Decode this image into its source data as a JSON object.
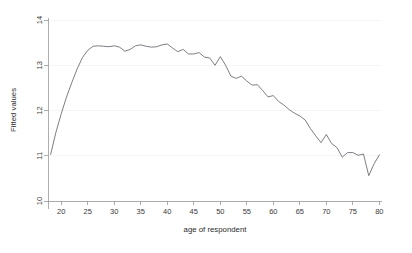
{
  "chart_data": {
    "type": "line",
    "title": "",
    "subtitle": "",
    "xlabel": "age of respondent",
    "ylabel": "Fitted values",
    "xlim": [
      17.5,
      80.5
    ],
    "ylim": [
      10,
      14
    ],
    "xticks": [
      20,
      25,
      30,
      35,
      40,
      45,
      50,
      55,
      60,
      65,
      70,
      75,
      80
    ],
    "yticks": [
      10,
      11,
      12,
      13,
      14
    ],
    "xtick_labels": [
      "20",
      "25",
      "30",
      "35",
      "40",
      "45",
      "50",
      "55",
      "60",
      "65",
      "70",
      "75",
      "80"
    ],
    "ytick_labels": [
      "10",
      "11",
      "12",
      "13",
      "14"
    ],
    "grid": "faint horizontal gridlines at y ticks",
    "legend": "none",
    "line_color": "#6e6e78",
    "series": [
      {
        "name": "Fitted values",
        "x": [
          18,
          19,
          20,
          21,
          22,
          23,
          24,
          25,
          26,
          27,
          28,
          29,
          30,
          31,
          32,
          33,
          34,
          35,
          36,
          37,
          38,
          39,
          40,
          41,
          42,
          43,
          44,
          45,
          46,
          47,
          48,
          49,
          50,
          51,
          52,
          53,
          54,
          55,
          56,
          57,
          58,
          59,
          60,
          61,
          62,
          63,
          64,
          65,
          66,
          67,
          68,
          69,
          70,
          71,
          72,
          73,
          74,
          75,
          76,
          77,
          78,
          79,
          80
        ],
        "values": [
          11.03,
          11.52,
          11.93,
          12.3,
          12.62,
          12.92,
          13.17,
          13.33,
          13.42,
          13.43,
          13.42,
          13.41,
          13.43,
          13.4,
          13.31,
          13.35,
          13.43,
          13.45,
          13.42,
          13.4,
          13.41,
          13.45,
          13.47,
          13.38,
          13.3,
          13.35,
          13.25,
          13.25,
          13.28,
          13.18,
          13.16,
          13.0,
          13.19,
          13.0,
          12.76,
          12.71,
          12.76,
          12.65,
          12.56,
          12.57,
          12.44,
          12.3,
          12.33,
          12.2,
          12.12,
          12.02,
          11.94,
          11.88,
          11.79,
          11.6,
          11.44,
          11.29,
          11.47,
          11.27,
          11.18,
          10.97,
          11.07,
          11.07,
          11.01,
          11.04,
          10.56,
          10.82,
          11.02
        ]
      }
    ]
  },
  "axes": {
    "x_title": "age of respondent",
    "y_title": "Fitted values"
  }
}
